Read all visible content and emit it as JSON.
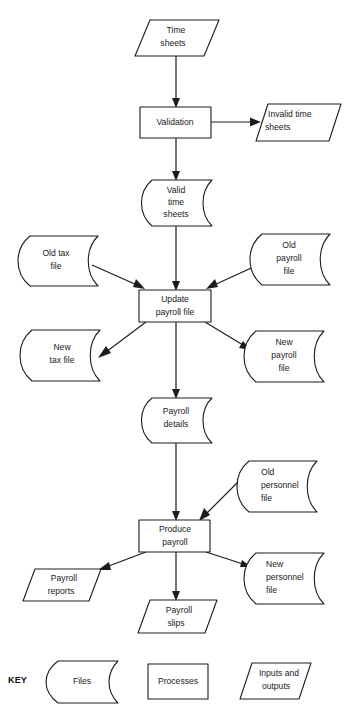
{
  "diagram": {
    "title_clipped": "",
    "type": "system-flowchart",
    "background_color": "#ffffff",
    "line_color": "#1c1c1c",
    "text_color": "#1a1a1a"
  },
  "nodes": {
    "time_sheets": {
      "label_lines": [
        "Time",
        "sheets"
      ],
      "shape": "input-output",
      "align": "center"
    },
    "validation": {
      "label_lines": [
        "Validation"
      ],
      "shape": "process",
      "align": "center"
    },
    "invalid_time_sheets": {
      "label_lines": [
        "Invalid time",
        "sheets"
      ],
      "shape": "input-output",
      "align": "left"
    },
    "valid_time_sheets": {
      "label_lines": [
        "Valid",
        "time",
        "sheets"
      ],
      "shape": "file",
      "align": "center"
    },
    "old_tax_file": {
      "label_lines": [
        "Old tax",
        "file"
      ],
      "shape": "file",
      "align": "center"
    },
    "old_payroll_file": {
      "label_lines": [
        "Old",
        "payroll",
        "file"
      ],
      "shape": "file",
      "align": "center"
    },
    "update_payroll_file": {
      "label_lines": [
        "Update",
        "payroll file"
      ],
      "shape": "process",
      "align": "center"
    },
    "new_tax_file": {
      "label_lines": [
        "New",
        "tax file"
      ],
      "shape": "file",
      "align": "center"
    },
    "new_payroll_file": {
      "label_lines": [
        "New",
        "payroll",
        "file"
      ],
      "shape": "file",
      "align": "center"
    },
    "payroll_details": {
      "label_lines": [
        "Payroll",
        "details"
      ],
      "shape": "file",
      "align": "center"
    },
    "old_personnel_file": {
      "label_lines": [
        "Old",
        "personnel",
        "file"
      ],
      "shape": "file",
      "align": "left"
    },
    "produce_payroll": {
      "label_lines": [
        "Produce",
        "payroll"
      ],
      "shape": "process",
      "align": "center"
    },
    "payroll_reports": {
      "label_lines": [
        "Payroll",
        "reports"
      ],
      "shape": "input-output",
      "align": "center"
    },
    "payroll_slips": {
      "label_lines": [
        "Payroll",
        "slips"
      ],
      "shape": "input-output",
      "align": "center"
    },
    "new_personnel_file": {
      "label_lines": [
        "New",
        "personnel",
        "file"
      ],
      "shape": "file",
      "align": "left"
    }
  },
  "key": {
    "title": "KEY",
    "items": [
      {
        "label": "Files",
        "shape": "file"
      },
      {
        "label": "Processes",
        "shape": "process"
      },
      {
        "label_lines": [
          "Inputs and",
          "outputs"
        ],
        "shape": "input-output"
      }
    ]
  },
  "flows": [
    {
      "from": "time_sheets",
      "to": "validation"
    },
    {
      "from": "validation",
      "to": "invalid_time_sheets"
    },
    {
      "from": "validation",
      "to": "valid_time_sheets"
    },
    {
      "from": "valid_time_sheets",
      "to": "update_payroll_file"
    },
    {
      "from": "old_tax_file",
      "to": "update_payroll_file"
    },
    {
      "from": "old_payroll_file",
      "to": "update_payroll_file"
    },
    {
      "from": "update_payroll_file",
      "to": "new_tax_file"
    },
    {
      "from": "update_payroll_file",
      "to": "new_payroll_file"
    },
    {
      "from": "update_payroll_file",
      "to": "payroll_details"
    },
    {
      "from": "payroll_details",
      "to": "produce_payroll"
    },
    {
      "from": "old_personnel_file",
      "to": "produce_payroll"
    },
    {
      "from": "produce_payroll",
      "to": "payroll_reports"
    },
    {
      "from": "produce_payroll",
      "to": "payroll_slips"
    },
    {
      "from": "produce_payroll",
      "to": "new_personnel_file"
    }
  ]
}
